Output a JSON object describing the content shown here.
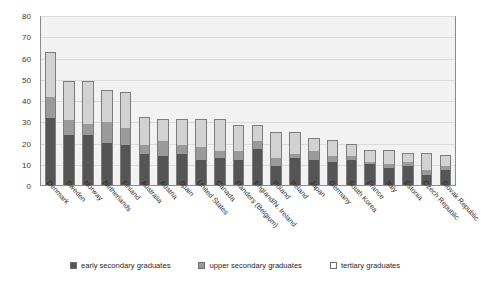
{
  "chart_data": {
    "type": "bar",
    "stacked": true,
    "title": "",
    "subtitle": "",
    "xlabel": "",
    "ylabel": "",
    "ylim": [
      0,
      80
    ],
    "y_ticks": [
      0,
      10,
      20,
      30,
      40,
      50,
      60,
      70,
      80
    ],
    "grid": true,
    "legend_position": "bottom",
    "categories": [
      "Denmark",
      "Sweden",
      "Norway",
      "Netherlands",
      "Finland",
      "Australia",
      "Austria",
      "Spain",
      "United States",
      "Canada",
      "Flanders (Belgium)",
      "England/N. Ireland",
      "Poland",
      "Ireland",
      "Japan",
      "Germany",
      "South Korea",
      "France",
      "Italy",
      "Estonia",
      "Czech Republic",
      "Slovak Republic"
    ],
    "series": [
      {
        "name": "early secondary graduates",
        "color": "#555555",
        "values": [
          32,
          24,
          24,
          20,
          19,
          15,
          14,
          15,
          12,
          13,
          12,
          17,
          9,
          13,
          12,
          11,
          12,
          10,
          8,
          9,
          5,
          7
        ]
      },
      {
        "name": "upper secondary graduates",
        "color": "#9a9a9a",
        "values": [
          10,
          7,
          5,
          10,
          8,
          4,
          7,
          4,
          6,
          3,
          4,
          4,
          4,
          2,
          4,
          3,
          2,
          1,
          2,
          2,
          2,
          2
        ]
      },
      {
        "name": "tertiary graduates",
        "color": "#d2d2d2",
        "values": [
          21,
          18,
          20,
          15,
          17,
          13,
          10,
          12,
          13,
          15,
          12,
          7,
          12,
          10,
          6,
          7,
          5,
          5,
          6,
          4,
          8,
          5
        ]
      }
    ],
    "totals": [
      63,
      49,
      49,
      45,
      44,
      32,
      31,
      31,
      31,
      31,
      28,
      28,
      25,
      25,
      22,
      21,
      19,
      16,
      16,
      15,
      15,
      14
    ]
  },
  "legend": {
    "items": [
      {
        "label": "early secondary graduates",
        "swatch": "legend-swatch-dark"
      },
      {
        "label": "upper secondary graduates",
        "swatch": "legend-swatch-gray"
      },
      {
        "label": "tertiary graduates",
        "swatch": "legend-swatch-light"
      }
    ]
  }
}
